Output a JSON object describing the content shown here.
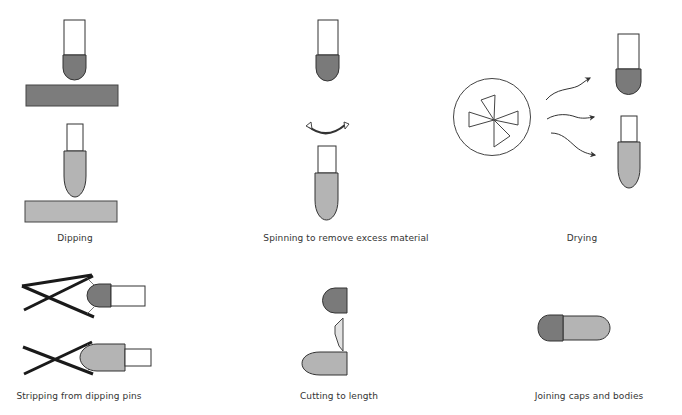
{
  "colors": {
    "background": "#ffffff",
    "outline": "#333333",
    "cap_fill": "#7a7a7a",
    "body_fill": "#b4b4b4",
    "cap_bath_fill": "#7c7c7c",
    "body_bath_fill": "#b8b8b8",
    "blade_fill": "#e2e2e2",
    "pin_fill": "#ffffff",
    "label_text": "#333333"
  },
  "steps": [
    {
      "id": "dipping",
      "label": "Dipping",
      "label_x": 75,
      "label_y": 233
    },
    {
      "id": "spinning",
      "label": "Spinning to remove excess material",
      "label_x": 346,
      "label_y": 233
    },
    {
      "id": "drying",
      "label": "Drying",
      "label_x": 582,
      "label_y": 233
    },
    {
      "id": "stripping",
      "label": "Stripping from dipping pins",
      "label_x": 79,
      "label_y": 391
    },
    {
      "id": "cutting",
      "label": "Cutting to length",
      "label_x": 339,
      "label_y": 391
    },
    {
      "id": "joining",
      "label": "Joining caps and bodies",
      "label_x": 589,
      "label_y": 391
    }
  ],
  "icons": {
    "spin_arrow": "curved-rotation-arrow",
    "fan": "fan-icon",
    "air_flow": "wavy-arrow-icon",
    "blade": "cutting-blade-icon"
  }
}
